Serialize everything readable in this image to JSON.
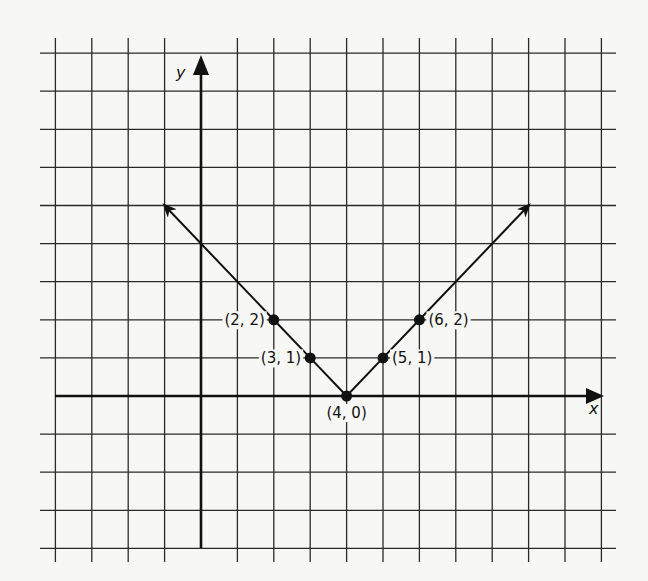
{
  "chart_data": {
    "type": "line",
    "title": "",
    "function": "y = |x - 4|",
    "xlabel": "x",
    "ylabel": "y",
    "grid": true,
    "xlim": [
      -4,
      11
    ],
    "ylim": [
      -4,
      9
    ],
    "series": [
      {
        "name": "absolute value graph",
        "points": [
          {
            "x": -1,
            "y": 5
          },
          {
            "x": 2,
            "y": 2
          },
          {
            "x": 3,
            "y": 1
          },
          {
            "x": 4,
            "y": 0
          },
          {
            "x": 5,
            "y": 1
          },
          {
            "x": 6,
            "y": 2
          },
          {
            "x": 9,
            "y": 5
          }
        ],
        "arrows_at_ends": true
      }
    ],
    "labeled_points": [
      {
        "x": 2,
        "y": 2,
        "label": "(2, 2)",
        "side": "left"
      },
      {
        "x": 3,
        "y": 1,
        "label": "(3, 1)",
        "side": "left"
      },
      {
        "x": 4,
        "y": 0,
        "label": "(4, 0)",
        "side": "below"
      },
      {
        "x": 5,
        "y": 1,
        "label": "(5, 1)",
        "side": "right"
      },
      {
        "x": 6,
        "y": 2,
        "label": "(6, 2)",
        "side": "right"
      }
    ]
  },
  "colors": {
    "background": "#f7f7f5",
    "grid": "#2a2a2a",
    "axis": "#111111",
    "line": "#111111"
  }
}
